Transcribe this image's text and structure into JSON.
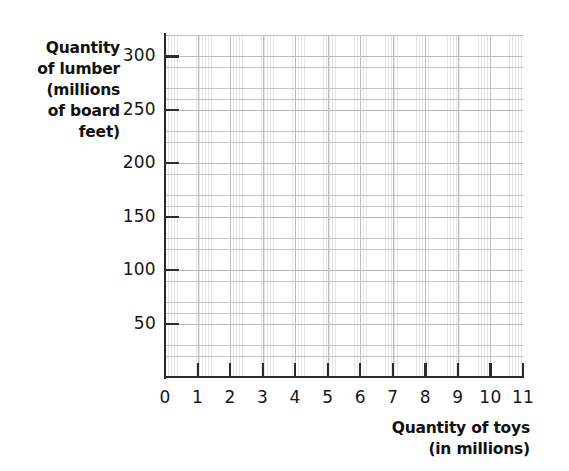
{
  "chart_data": {
    "type": "line",
    "title": "",
    "subtitle": "",
    "xlabel_lines": [
      "Quantity of toys",
      "(in millions)"
    ],
    "ylabel_lines": [
      "Quantity",
      "of lumber",
      "(millions",
      "of board",
      "feet)"
    ],
    "xlabel": "Quantity of toys (in millions)",
    "ylabel": "Quantity of lumber (millions of board feet)",
    "x_ticks": [
      0,
      1,
      2,
      3,
      4,
      5,
      6,
      7,
      8,
      9,
      10,
      11
    ],
    "x_tick_labels": [
      "0",
      "1",
      "2",
      "3",
      "4",
      "5",
      "6",
      "7",
      "8",
      "9",
      "10",
      "11"
    ],
    "y_ticks": [
      50,
      100,
      150,
      200,
      250,
      300
    ],
    "y_tick_labels": [
      "50",
      "100",
      "150",
      "200",
      "250",
      "300"
    ],
    "xlim": [
      0,
      11
    ],
    "ylim": [
      0,
      320
    ],
    "grid": true,
    "grid_style": "fine dotted minor grid with light major gridlines",
    "legend": null,
    "legend_position": "none",
    "series": [],
    "annotations": [],
    "note": "Blank graph paper / empty coordinate grid with no plotted data series"
  },
  "axes": {
    "y_axis_color": "#2b2b2b",
    "x_axis_color": "#2b2b2b",
    "grid_major_color": "#bdbdbd",
    "grid_minor_color": "#c8c8c8",
    "background_color": "#ffffff",
    "text_color": "#161616"
  }
}
